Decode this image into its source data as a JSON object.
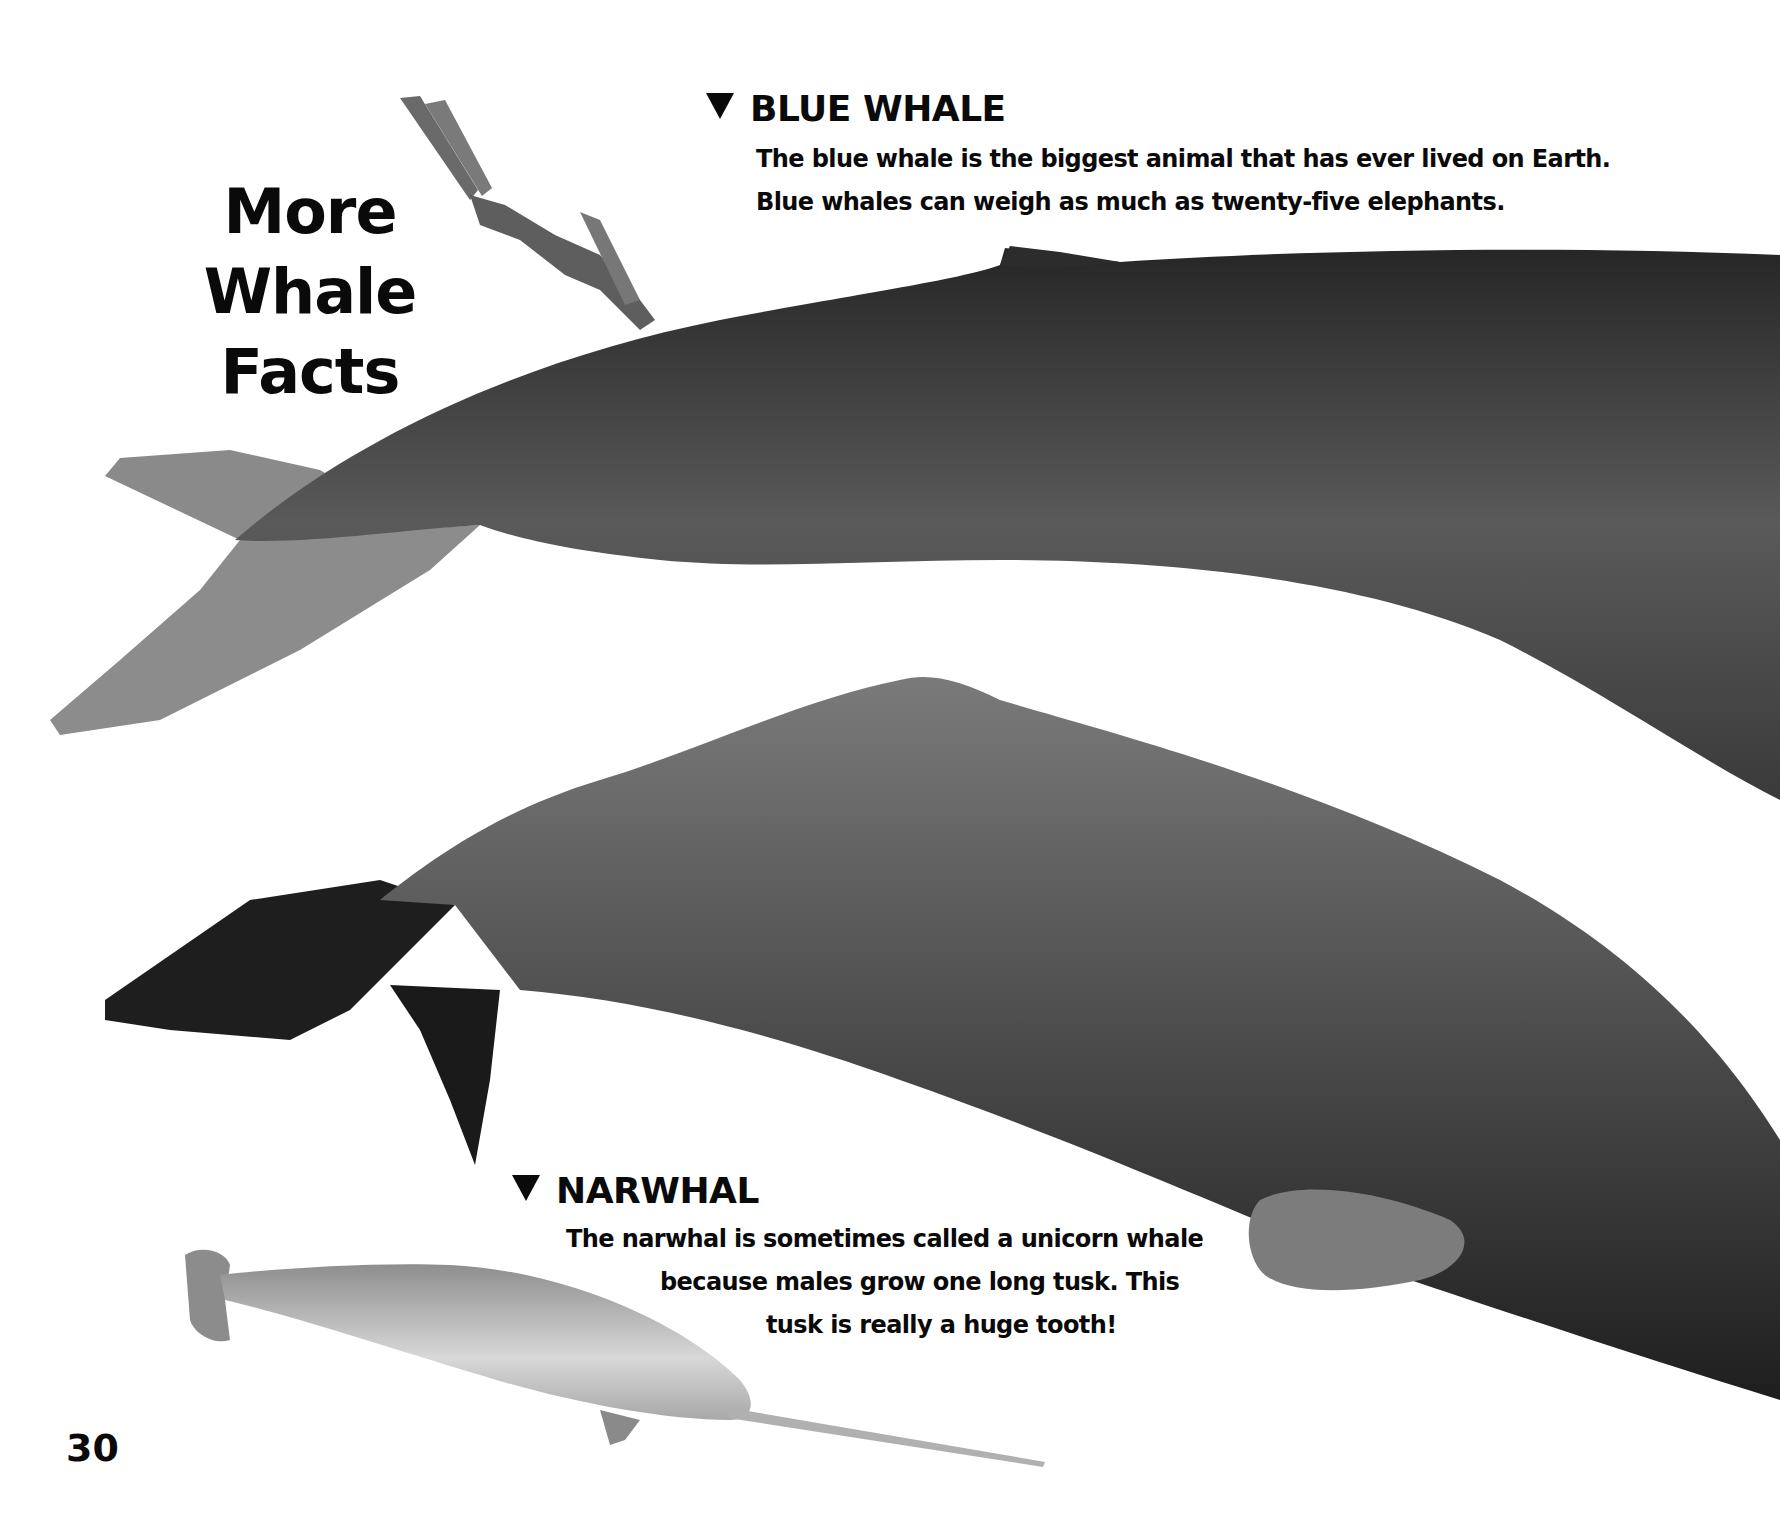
{
  "page": {
    "title_line1": "More",
    "title_line2": "Whale Facts",
    "page_number": "30"
  },
  "sections": {
    "blue_whale": {
      "heading": "BLUE WHALE",
      "marker_icon": "down-triangle-icon",
      "lines": [
        "The blue whale is the biggest animal that has ever lived on Earth.",
        "Blue whales can weigh as much as twenty-five elephants."
      ]
    },
    "narwhal": {
      "heading": "NARWHAL",
      "marker_icon": "down-triangle-icon",
      "lines": [
        "The narwhal is sometimes called a unicorn whale",
        "because males grow one long tusk. This",
        "tusk  is really a huge tooth!"
      ]
    }
  },
  "illustrations": [
    {
      "name": "scuba-diver",
      "description": "diver with fins swimming downward"
    },
    {
      "name": "blue-whale",
      "description": "blue whale tail and body, grayscale"
    },
    {
      "name": "sperm-whale",
      "description": "large whale body with fluke and flipper, grayscale"
    },
    {
      "name": "narwhal",
      "description": "narwhal with long spiral tusk"
    }
  ],
  "colors": {
    "background": "#ffffff",
    "text": "#0a0a0a",
    "blue_whale_dark": "#2a2a2a",
    "blue_whale_mid": "#6a6a6a",
    "tail_light": "#8c8c8c",
    "sperm_whale_dark": "#1c1c1c",
    "sperm_whale_mid": "#6e6e6e",
    "narwhal_light": "#d4d4d4",
    "narwhal_mid": "#9a9a9a"
  }
}
